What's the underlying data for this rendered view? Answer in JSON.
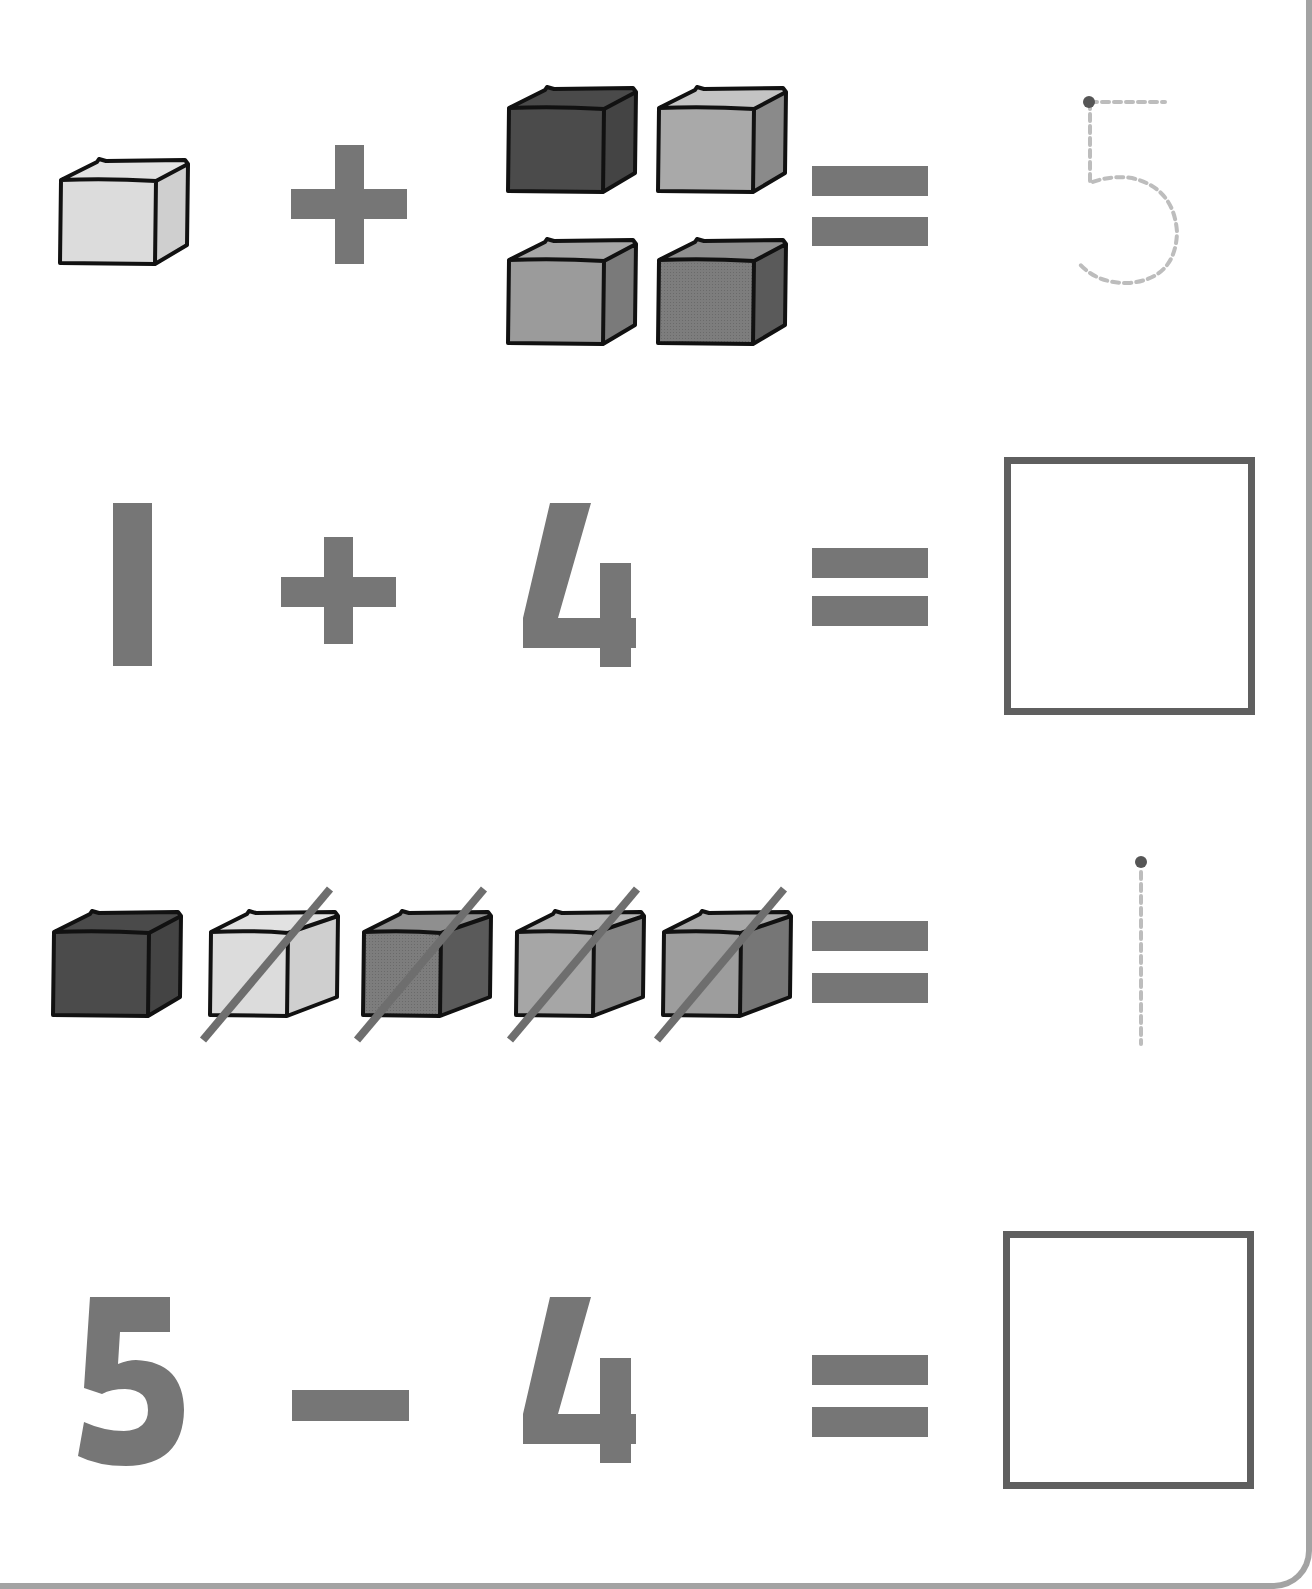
{
  "worksheet": {
    "title": "Addition and subtraction with cubes",
    "colors": {
      "symbol": "#767676",
      "box_border": "#5f5f5f",
      "trace_dash": "#bdbdbd",
      "trace_dot": "#555555",
      "cube_outline": "#111111",
      "page_border": "#a3a3a3"
    },
    "rows": [
      {
        "type": "picture-addition",
        "left_cubes": 1,
        "operator": "+",
        "right_cubes": 4,
        "equals": "=",
        "answer_trace": "5"
      },
      {
        "type": "number-addition",
        "left_number": "1",
        "operator": "+",
        "right_number": "4",
        "equals": "=",
        "answer": ""
      },
      {
        "type": "picture-subtraction",
        "total_cubes": 5,
        "crossed_out_cubes": 4,
        "equals": "=",
        "answer_trace": "1"
      },
      {
        "type": "number-subtraction",
        "left_number": "5",
        "operator": "−",
        "right_number": "4",
        "equals": "=",
        "answer": ""
      }
    ]
  }
}
